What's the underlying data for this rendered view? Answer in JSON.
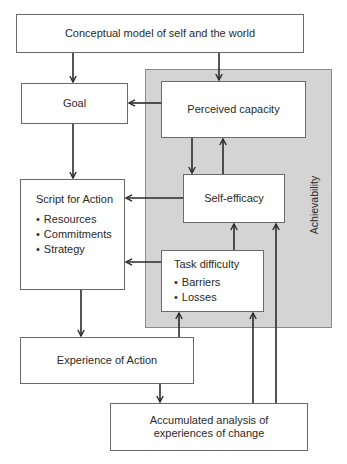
{
  "diagram": {
    "panel_label": "Achievability",
    "nodes": {
      "conceptual_model": "Conceptual model of self and the world",
      "goal": "Goal",
      "perceived_capacity": "Perceived capacity",
      "script_for_action": {
        "title": "Script for Action",
        "items": [
          "Resources",
          "Commitments",
          "Strategy"
        ]
      },
      "self_efficacy": "Self-efficacy",
      "task_difficulty": {
        "title": "Task difficulty",
        "items": [
          "Barriers",
          "Losses"
        ]
      },
      "experience_of_action": "Experience of Action",
      "accumulated_analysis": {
        "line1": "Accumulated analysis of",
        "line2": "experiences of change"
      }
    },
    "edges": [
      {
        "from": "Conceptual model of self and the world",
        "to": "Goal"
      },
      {
        "from": "Conceptual model of self and the world",
        "to": "Perceived capacity"
      },
      {
        "from": "Perceived capacity",
        "to": "Goal"
      },
      {
        "from": "Perceived capacity",
        "to": "Self-efficacy"
      },
      {
        "from": "Self-efficacy",
        "to": "Perceived capacity"
      },
      {
        "from": "Goal",
        "to": "Script for Action"
      },
      {
        "from": "Self-efficacy",
        "to": "Script for Action"
      },
      {
        "from": "Task difficulty",
        "to": "Script for Action"
      },
      {
        "from": "Task difficulty",
        "to": "Self-efficacy"
      },
      {
        "from": "Script for Action",
        "to": "Experience of Action"
      },
      {
        "from": "Experience of Action",
        "to": "Task difficulty"
      },
      {
        "from": "Experience of Action",
        "to": "Accumulated analysis of experiences of change"
      },
      {
        "from": "Accumulated analysis of experiences of change",
        "to": "Task difficulty"
      },
      {
        "from": "Accumulated analysis of experiences of change",
        "to": "Self-efficacy"
      }
    ],
    "colors": {
      "panel_fill": "#d4d4d4",
      "box_fill": "#ffffff",
      "stroke": "#2a2a2a"
    }
  }
}
